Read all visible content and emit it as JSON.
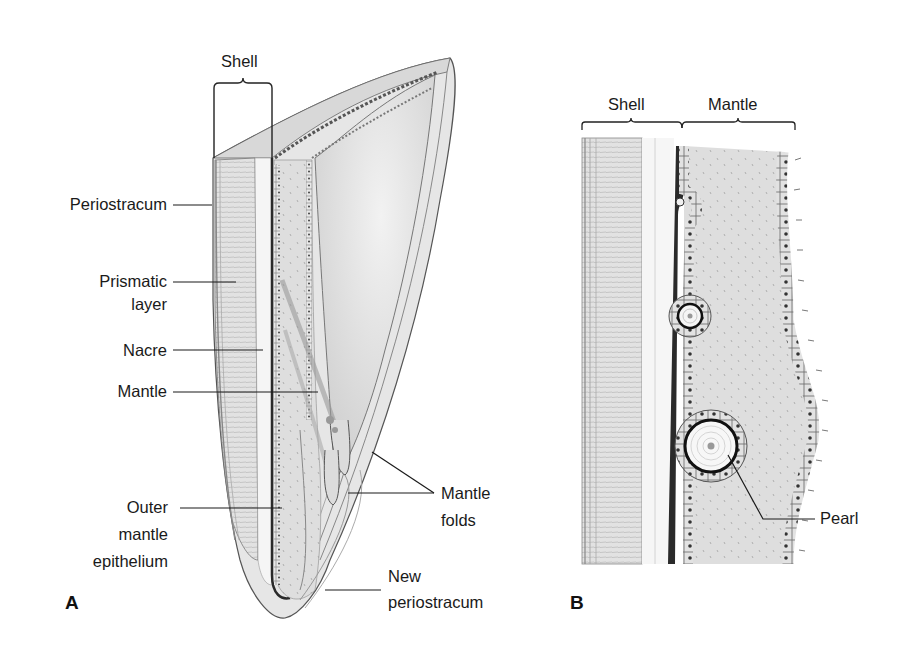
{
  "figure": {
    "panels": [
      {
        "id": "A",
        "letter": "A",
        "bracket_label": "Shell",
        "labels": {
          "periostracum": "Periostracum",
          "prismatic_line1": "Prismatic",
          "prismatic_line2": "layer",
          "nacre": "Nacre",
          "mantle": "Mantle",
          "outer_line1": "Outer",
          "outer_line2": "mantle",
          "outer_line3": "epithelium",
          "folds_line1": "Mantle",
          "folds_line2": "folds",
          "newperi_line1": "New",
          "newperi_line2": "periostracum"
        }
      },
      {
        "id": "B",
        "letter": "B",
        "bracket_labels": {
          "shell": "Shell",
          "mantle": "Mantle"
        },
        "labels": {
          "pearl": "Pearl"
        }
      }
    ],
    "colors": {
      "ink": "#1a1a1a",
      "shell_fill": "#e4e4e4",
      "nacre_fill": "#f4f4f4",
      "mantle_fill": "#dcdcdc",
      "inner_fill": "#d6d6d6",
      "dark_layer": "#2a2a2a"
    }
  }
}
